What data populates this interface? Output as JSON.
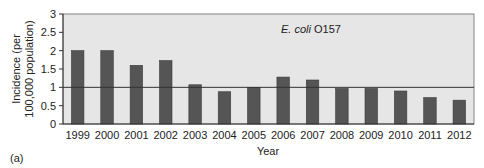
{
  "chart_data": {
    "type": "bar",
    "title": "",
    "annotation": {
      "italic": "E. coli",
      "normal": " O157"
    },
    "xlabel": "Year",
    "ylabel_lines": [
      "Incidence (per",
      "100,000 population)"
    ],
    "ylabel": "Incidence (per 100,000 population)",
    "categories": [
      "1999",
      "2000",
      "2001",
      "2002",
      "2003",
      "2004",
      "2005",
      "2006",
      "2007",
      "2008",
      "2009",
      "2010",
      "2011",
      "2012"
    ],
    "values": [
      2.0,
      2.0,
      1.6,
      1.73,
      1.07,
      0.88,
      1.0,
      1.28,
      1.2,
      0.97,
      0.97,
      0.9,
      0.72,
      0.65
    ],
    "ylim": [
      0,
      3
    ],
    "yticks": [
      0,
      0.5,
      1,
      1.5,
      2,
      2.5,
      3
    ],
    "ytick_labels": [
      "0",
      "0.5",
      "1",
      "1.5",
      "2",
      "2.5",
      "3"
    ],
    "reference_line": 1.0,
    "grid": false,
    "legend": null,
    "colors": {
      "bar": "#555555",
      "plot_bg": "#e6e6e6",
      "axis": "#333333"
    }
  },
  "panel_label": "(a)"
}
